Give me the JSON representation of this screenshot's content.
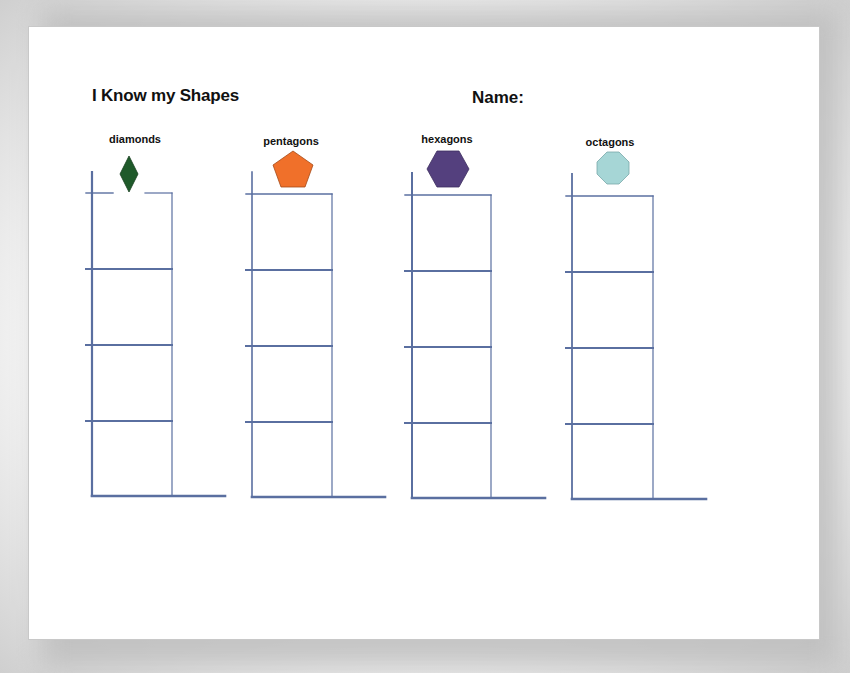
{
  "worksheet": {
    "title": "I Know my Shapes",
    "name_label": "Name:",
    "line_color": "#5a6fa0",
    "columns": [
      {
        "label": "diamonds",
        "shape": "diamond-icon",
        "color": "#1f5a2a",
        "rows": 4
      },
      {
        "label": "pentagons",
        "shape": "pentagon-icon",
        "color": "#f0702a",
        "rows": 4
      },
      {
        "label": "hexagons",
        "shape": "hexagon-icon",
        "color": "#54407e",
        "rows": 4
      },
      {
        "label": "octagons",
        "shape": "octagon-icon",
        "color": "#a6d6d6",
        "rows": 4
      }
    ]
  }
}
